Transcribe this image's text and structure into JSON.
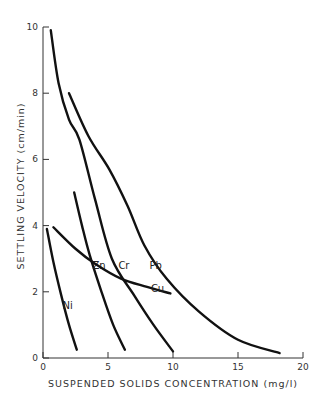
{
  "chart_data": {
    "type": "line",
    "title": "",
    "xlabel": "SUSPENDED SOLIDS CONCENTRATION (mg/l)",
    "ylabel": "SETTLING VELOCITY (cm/min)",
    "xlim": [
      0,
      20
    ],
    "ylim": [
      0,
      10
    ],
    "xticks": [
      0,
      5,
      10,
      15,
      20
    ],
    "yticks": [
      0,
      2,
      4,
      6,
      8,
      10
    ],
    "grid": false,
    "legend": "inline labels",
    "series": [
      {
        "name": "Ni",
        "label_pos": [
          1.5,
          1.6
        ],
        "points": [
          [
            0.3,
            3.9
          ],
          [
            0.8,
            2.9
          ],
          [
            1.4,
            1.9
          ],
          [
            2.0,
            1.0
          ],
          [
            2.6,
            0.25
          ]
        ]
      },
      {
        "name": "Zn",
        "label_pos": [
          3.8,
          2.8
        ],
        "points": [
          [
            2.4,
            5.0
          ],
          [
            3.0,
            4.0
          ],
          [
            3.6,
            3.1
          ],
          [
            4.5,
            2.0
          ],
          [
            5.4,
            1.0
          ],
          [
            6.3,
            0.25
          ]
        ]
      },
      {
        "name": "Cr",
        "label_pos": [
          5.8,
          2.8
        ],
        "points": [
          [
            0.6,
            9.9
          ],
          [
            1.2,
            8.3
          ],
          [
            2.0,
            7.2
          ],
          [
            2.8,
            6.6
          ],
          [
            4.0,
            4.8
          ],
          [
            5.3,
            3.0
          ],
          [
            7.0,
            1.9
          ],
          [
            8.5,
            1.0
          ],
          [
            10.0,
            0.2
          ]
        ]
      },
      {
        "name": "Pb",
        "label_pos": [
          8.2,
          2.8
        ],
        "points": [
          [
            2.0,
            8.0
          ],
          [
            3.5,
            6.7
          ],
          [
            5.1,
            5.7
          ],
          [
            6.5,
            4.6
          ],
          [
            7.8,
            3.4
          ],
          [
            9.5,
            2.4
          ],
          [
            12.0,
            1.4
          ],
          [
            15.0,
            0.55
          ],
          [
            18.2,
            0.15
          ]
        ]
      },
      {
        "name": "Cu",
        "label_pos": [
          8.3,
          2.1
        ],
        "points": [
          [
            0.8,
            3.95
          ],
          [
            2.5,
            3.3
          ],
          [
            4.0,
            2.85
          ],
          [
            6.0,
            2.4
          ],
          [
            8.0,
            2.15
          ],
          [
            9.8,
            1.95
          ]
        ]
      }
    ]
  }
}
